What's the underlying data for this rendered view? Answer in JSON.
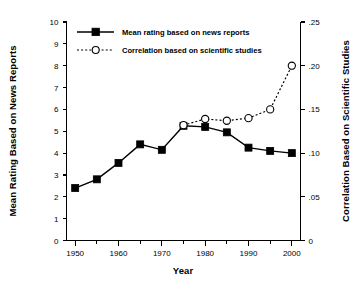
{
  "chart_data": {
    "type": "line",
    "title": "",
    "xlabel": "Year",
    "grid": false,
    "legend_position": "top-left-inside",
    "x": [
      1950,
      1955,
      1960,
      1965,
      1970,
      1975,
      1980,
      1985,
      1990,
      1995,
      2000
    ],
    "xlim": [
      1948,
      2002
    ],
    "x_ticks_major": [
      1950,
      1960,
      1970,
      1980,
      1990,
      2000
    ],
    "x_tick_labels": [
      "1950",
      "1960",
      "1970",
      "1980",
      "1990",
      "2000"
    ],
    "x_ticks_minor": [
      1955,
      1965,
      1975,
      1985,
      1995
    ],
    "left_axis": {
      "label": "Mean Rating Based on News Reports",
      "lim": [
        0,
        10
      ],
      "ticks": [
        0,
        1,
        2,
        3,
        4,
        5,
        6,
        7,
        8,
        9,
        10
      ],
      "tick_labels": [
        "0",
        "1",
        "2",
        "3",
        "4",
        "5",
        "6",
        "7",
        "8",
        "9",
        "10"
      ]
    },
    "right_axis": {
      "label": "Correlation Based on Scientific Studies",
      "lim": [
        0,
        0.25
      ],
      "ticks": [
        0,
        0.05,
        0.1,
        0.15,
        0.2,
        0.25
      ],
      "tick_labels": [
        "0",
        ".05",
        ".10",
        ".15",
        ".20",
        ".25"
      ]
    },
    "series": [
      {
        "name": "Mean rating based on news reports",
        "axis": "left",
        "marker": "filled-square",
        "line_style": "solid",
        "x": [
          1950,
          1955,
          1960,
          1965,
          1970,
          1975,
          1980,
          1985,
          1990,
          1995,
          2000
        ],
        "values": [
          2.4,
          2.8,
          3.55,
          4.4,
          4.15,
          5.25,
          5.2,
          4.95,
          4.25,
          4.1,
          4.0
        ]
      },
      {
        "name": "Correlation based on scientific studies",
        "axis": "right",
        "marker": "open-circle",
        "line_style": "dashed",
        "x": [
          1975,
          1980,
          1985,
          1990,
          1995,
          2000
        ],
        "values": [
          0.132,
          0.139,
          0.137,
          0.14,
          0.15,
          0.2
        ]
      }
    ]
  },
  "legend": {
    "entries": [
      {
        "label": "Mean rating based on news reports",
        "marker": "filled-square",
        "line_style": "solid"
      },
      {
        "label": "Correlation based on scientific studies",
        "marker": "open-circle",
        "line_style": "dashed"
      }
    ]
  },
  "labels": {
    "left_axis_title": "Mean Rating Based on News Reports",
    "right_axis_title": "Correlation Based on Scientific Studies",
    "x_axis_title": "Year"
  },
  "colors": {
    "ink": "#000000",
    "background": "#ffffff"
  }
}
